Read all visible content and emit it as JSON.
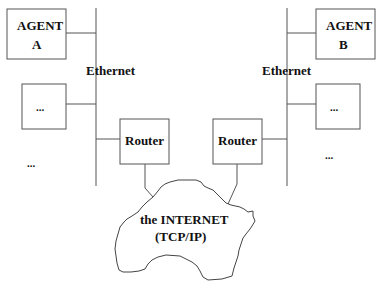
{
  "diagram": {
    "left_network": {
      "agent": {
        "line1": "AGENT",
        "line2": "A"
      },
      "ethernet_label": "Ethernet",
      "placeholder_box": "...",
      "placeholder_more": "...",
      "router_label": "Router"
    },
    "right_network": {
      "agent": {
        "line1": "AGENT",
        "line2": "B"
      },
      "ethernet_label": "Ethernet",
      "placeholder_box": "...",
      "placeholder_more": "...",
      "router_label": "Router"
    },
    "internet": {
      "line1": "the INTERNET",
      "line2": "(TCP/IP)"
    }
  }
}
